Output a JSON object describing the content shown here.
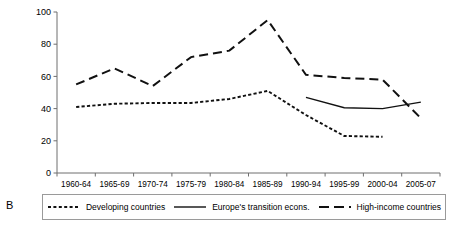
{
  "panel": {
    "label": "B"
  },
  "legend": {
    "entries": [
      {
        "label": "Developing countries",
        "style": "dotted",
        "swatch": "dotted-line-swatch"
      },
      {
        "label": "Europe's transition econs.",
        "style": "solid",
        "swatch": "solid-line-swatch"
      },
      {
        "label": "High-income countries",
        "style": "dashed",
        "swatch": "dashed-line-swatch"
      }
    ]
  },
  "axis": {
    "y_ticks": [
      "0",
      "20",
      "40",
      "60",
      "80",
      "100"
    ],
    "x_ticks": [
      "1960-64",
      "1965-69",
      "1970-74",
      "1975-79",
      "1980-84",
      "1985-89",
      "1990-94",
      "1995-99",
      "2000-04",
      "2005-07"
    ]
  },
  "colors": {
    "line": "#111111",
    "axis": "#6f6f6f",
    "legend_border": "#9a9a9a"
  },
  "chart_data": {
    "type": "line",
    "title": "",
    "xlabel": "",
    "ylabel": "",
    "ylim": [
      0,
      100
    ],
    "yticks": [
      0,
      20,
      40,
      60,
      80,
      100
    ],
    "grid": false,
    "legend_position": "below",
    "categories": [
      "1960-64",
      "1965-69",
      "1970-74",
      "1975-79",
      "1980-84",
      "1985-89",
      "1990-94",
      "1995-99",
      "2000-04",
      "2005-07"
    ],
    "series": [
      {
        "name": "Developing countries",
        "style": "dotted",
        "values": [
          41,
          43,
          43.5,
          43.5,
          46,
          51,
          36,
          23,
          22.5,
          null
        ]
      },
      {
        "name": "Europe's transition econs.",
        "style": "solid",
        "values": [
          null,
          null,
          null,
          null,
          null,
          null,
          47,
          40.5,
          40,
          44
        ]
      },
      {
        "name": "High-income countries",
        "style": "dashed",
        "values": [
          55,
          65,
          54,
          72,
          76,
          95,
          61,
          59,
          58,
          34
        ]
      }
    ]
  }
}
